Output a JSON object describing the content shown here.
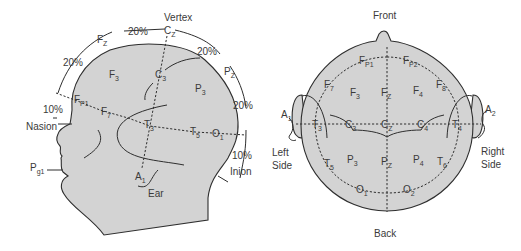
{
  "side_view": {
    "title": "Vertex",
    "landmarks": {
      "nasion": "Nasion",
      "inion": "Inion",
      "ear": "Ear"
    },
    "percentages": {
      "fz_cz": "20%",
      "cz_pz": "20%",
      "fp1_fz": "20%",
      "pz_o1": "20%",
      "nasion_fp1": "10%",
      "o1_inion": "10%"
    },
    "electrodes": [
      {
        "id": "fz",
        "main": "F",
        "sub": "Z"
      },
      {
        "id": "cz",
        "main": "C",
        "sub": "Z"
      },
      {
        "id": "pz",
        "main": "P",
        "sub": "Z"
      },
      {
        "id": "f3",
        "main": "F",
        "sub": "3"
      },
      {
        "id": "c3",
        "main": "C",
        "sub": "3"
      },
      {
        "id": "p3",
        "main": "P",
        "sub": "3"
      },
      {
        "id": "fp1",
        "main": "F",
        "sub": "P1"
      },
      {
        "id": "f7",
        "main": "F",
        "sub": "7"
      },
      {
        "id": "t3",
        "main": "T",
        "sub": "3"
      },
      {
        "id": "t5",
        "main": "T",
        "sub": "5"
      },
      {
        "id": "o1",
        "main": "O",
        "sub": "1"
      },
      {
        "id": "a1",
        "main": "A",
        "sub": "1"
      },
      {
        "id": "pg1",
        "main": "P",
        "sub": "g1"
      }
    ]
  },
  "top_view": {
    "front": "Front",
    "back": "Back",
    "left_side": [
      "Left",
      "Side"
    ],
    "right_side": [
      "Right",
      "Side"
    ],
    "electrodes": [
      {
        "id": "fp1",
        "main": "F",
        "sub": "P1"
      },
      {
        "id": "fp2",
        "main": "F",
        "sub": "P2"
      },
      {
        "id": "f7",
        "main": "F",
        "sub": "7"
      },
      {
        "id": "f3",
        "main": "F",
        "sub": "3"
      },
      {
        "id": "fz",
        "main": "F",
        "sub": "Z"
      },
      {
        "id": "f4",
        "main": "F",
        "sub": "4"
      },
      {
        "id": "f8",
        "main": "F",
        "sub": "8"
      },
      {
        "id": "a1",
        "main": "A",
        "sub": "1"
      },
      {
        "id": "t3",
        "main": "T",
        "sub": "3"
      },
      {
        "id": "c3",
        "main": "C",
        "sub": "3"
      },
      {
        "id": "cz",
        "main": "C",
        "sub": "Z"
      },
      {
        "id": "c4",
        "main": "C",
        "sub": "4"
      },
      {
        "id": "t4",
        "main": "T",
        "sub": "4"
      },
      {
        "id": "a2",
        "main": "A",
        "sub": "2"
      },
      {
        "id": "t5",
        "main": "T",
        "sub": "5"
      },
      {
        "id": "p3",
        "main": "P",
        "sub": "3"
      },
      {
        "id": "pz",
        "main": "P",
        "sub": "Z"
      },
      {
        "id": "p4",
        "main": "P",
        "sub": "4"
      },
      {
        "id": "t6",
        "main": "T",
        "sub": "6"
      },
      {
        "id": "o1",
        "main": "O",
        "sub": "1"
      },
      {
        "id": "o2",
        "main": "O",
        "sub": "2"
      }
    ]
  },
  "colors": {
    "head_fill": "#d3d3d3",
    "line": "#2e2e2e",
    "text": "#3a3a3a",
    "background": "#ffffff"
  }
}
